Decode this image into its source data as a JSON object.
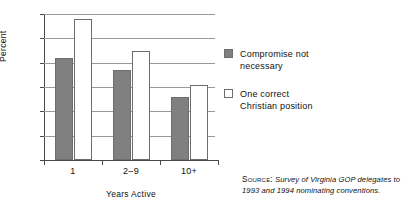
{
  "chart_data": {
    "type": "bar",
    "title": "",
    "subtitle": "",
    "xlabel": "Years Active",
    "ylabel": "Percent",
    "categories": [
      "1",
      "2–9",
      "10+"
    ],
    "series": [
      {
        "name": "Compromise not necessary",
        "values": [
          42,
          37,
          26
        ],
        "color": "#808080"
      },
      {
        "name": "One correct Christian position",
        "values": [
          58,
          45,
          31
        ],
        "color": "#ffffff"
      }
    ],
    "ylim": [
      0,
      60
    ],
    "yticks": [
      0,
      10,
      20,
      30,
      40,
      50,
      60
    ],
    "ytick_labels": [
      "0",
      "10",
      "20",
      "30",
      "40",
      "50",
      "60"
    ],
    "grid": "horizontal",
    "legend_position": "right"
  },
  "legend": {
    "items": [
      {
        "label_line1": "Compromise not",
        "label_line2": "necessary",
        "swatch": "filled-gray-swatch"
      },
      {
        "label_line1": "One correct",
        "label_line2": "Christian position",
        "swatch": "open-white-swatch"
      }
    ]
  },
  "source": {
    "label": "Source:",
    "line1": "Survey of Virginia GOP delegates to",
    "line2": "1993 and 1994 nominating conventions."
  }
}
